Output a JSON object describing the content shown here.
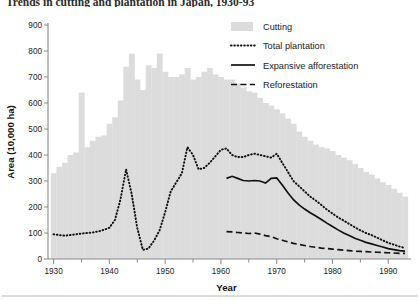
{
  "title": "Trends in cutting and plantation in Japan, 1930-93",
  "axes": {
    "y_label": "Area (10,000 ha)",
    "x_label": "Year",
    "y_ticks": [
      0,
      100,
      200,
      300,
      400,
      500,
      600,
      700,
      800,
      900
    ],
    "x_ticks": [
      1930,
      1940,
      1950,
      1960,
      1970,
      1980,
      1990
    ],
    "x_minor_step": 5,
    "ylim": [
      0,
      900
    ],
    "xlim": [
      1929,
      1993
    ],
    "grid": false
  },
  "legend": {
    "position": "top-right",
    "items": [
      {
        "label": "Cutting",
        "marker": "filled-bar",
        "color": "#dcdcdc"
      },
      {
        "label": "Total plantation",
        "marker": "dotted-line",
        "color": "#111111"
      },
      {
        "label": "Expansive afforestation",
        "marker": "solid-line",
        "color": "#111111"
      },
      {
        "label": "Reforestation",
        "marker": "dashed-line",
        "color": "#111111"
      }
    ]
  },
  "chart_data": {
    "type": "bar",
    "title": "Trends in cutting and plantation in Japan, 1930-93",
    "xlabel": "Year",
    "ylabel": "Area (10,000 ha)",
    "ylim": [
      0,
      900
    ],
    "xlim": [
      1929,
      1993
    ],
    "x": [
      1930,
      1931,
      1932,
      1933,
      1934,
      1935,
      1936,
      1937,
      1938,
      1939,
      1940,
      1941,
      1942,
      1943,
      1944,
      1945,
      1946,
      1947,
      1948,
      1949,
      1950,
      1951,
      1952,
      1953,
      1954,
      1955,
      1956,
      1957,
      1958,
      1959,
      1960,
      1961,
      1962,
      1963,
      1964,
      1965,
      1966,
      1967,
      1968,
      1969,
      1970,
      1971,
      1972,
      1973,
      1974,
      1975,
      1976,
      1977,
      1978,
      1979,
      1980,
      1981,
      1982,
      1983,
      1984,
      1985,
      1986,
      1987,
      1988,
      1989,
      1990,
      1991,
      1992,
      1993
    ],
    "series": [
      {
        "name": "Cutting",
        "type": "bar",
        "color": "#dcdcdc",
        "values": [
          330,
          355,
          370,
          400,
          410,
          640,
          430,
          455,
          470,
          475,
          520,
          545,
          610,
          740,
          790,
          690,
          650,
          745,
          735,
          790,
          720,
          700,
          700,
          710,
          735,
          690,
          700,
          720,
          735,
          710,
          700,
          690,
          690,
          675,
          660,
          645,
          640,
          620,
          600,
          590,
          575,
          560,
          540,
          520,
          490,
          470,
          455,
          440,
          430,
          425,
          415,
          400,
          390,
          380,
          365,
          350,
          335,
          325,
          310,
          295,
          285,
          270,
          255,
          240
        ]
      },
      {
        "name": "Total plantation",
        "type": "line",
        "style": "dotted",
        "color": "#111111",
        "x": [
          1930,
          1931,
          1932,
          1933,
          1934,
          1935,
          1936,
          1937,
          1938,
          1939,
          1940,
          1941,
          1942,
          1943,
          1944,
          1945,
          1946,
          1947,
          1948,
          1949,
          1950,
          1951,
          1952,
          1953,
          1954,
          1955,
          1956,
          1957,
          1958,
          1959,
          1960,
          1961,
          1962,
          1963,
          1964,
          1965,
          1966,
          1967,
          1968,
          1969,
          1970,
          1971,
          1972,
          1973,
          1974,
          1975,
          1976,
          1977,
          1978,
          1979,
          1980,
          1981,
          1982,
          1983,
          1984,
          1985,
          1986,
          1987,
          1988,
          1989,
          1990,
          1991,
          1992,
          1993
        ],
        "values": [
          95,
          92,
          90,
          92,
          95,
          98,
          100,
          102,
          106,
          112,
          120,
          150,
          230,
          345,
          250,
          120,
          35,
          40,
          70,
          110,
          180,
          260,
          295,
          330,
          430,
          400,
          345,
          350,
          370,
          395,
          420,
          425,
          400,
          392,
          392,
          400,
          405,
          400,
          395,
          390,
          405,
          370,
          335,
          300,
          280,
          260,
          240,
          225,
          208,
          190,
          175,
          160,
          148,
          135,
          122,
          110,
          100,
          92,
          82,
          72,
          62,
          55,
          48,
          42
        ]
      },
      {
        "name": "Expansive afforestation",
        "type": "line",
        "style": "solid",
        "color": "#111111",
        "x": [
          1961,
          1962,
          1963,
          1964,
          1965,
          1966,
          1967,
          1968,
          1969,
          1970,
          1971,
          1972,
          1973,
          1974,
          1975,
          1976,
          1977,
          1978,
          1979,
          1980,
          1981,
          1982,
          1983,
          1984,
          1985,
          1986,
          1987,
          1988,
          1989,
          1990,
          1991,
          1992,
          1993
        ],
        "values": [
          310,
          318,
          310,
          302,
          300,
          302,
          300,
          292,
          310,
          312,
          285,
          255,
          228,
          208,
          192,
          178,
          165,
          152,
          138,
          125,
          112,
          100,
          90,
          80,
          72,
          64,
          58,
          52,
          46,
          40,
          36,
          32,
          30
        ]
      },
      {
        "name": "Reforestation",
        "type": "line",
        "style": "dashed",
        "color": "#111111",
        "x": [
          1961,
          1962,
          1963,
          1964,
          1965,
          1966,
          1967,
          1968,
          1969,
          1970,
          1971,
          1972,
          1973,
          1974,
          1975,
          1976,
          1977,
          1978,
          1979,
          1980,
          1981,
          1982,
          1983,
          1984,
          1985,
          1986,
          1987,
          1988,
          1989,
          1990,
          1991,
          1992,
          1993
        ],
        "values": [
          105,
          104,
          102,
          100,
          98,
          100,
          96,
          90,
          86,
          78,
          72,
          66,
          60,
          56,
          52,
          48,
          45,
          42,
          40,
          38,
          36,
          34,
          32,
          30,
          29,
          28,
          27,
          26,
          25,
          24,
          23,
          22,
          22
        ]
      }
    ]
  }
}
